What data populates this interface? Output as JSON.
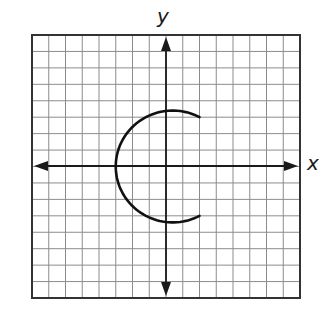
{
  "chart_data": {
    "type": "line",
    "title": "",
    "xlabel": "x",
    "ylabel": "y",
    "xlim": [
      -8,
      8
    ],
    "ylim": [
      -8,
      8
    ],
    "grid": true,
    "grid_units": {
      "columns": 16,
      "rows": 16,
      "step": 1
    },
    "axes_arrows": true,
    "tick_labels": false,
    "series": [
      {
        "name": "curve",
        "shape": "circular arc (open on right)",
        "circle_center": [
          0.4,
          0
        ],
        "radius": 3.4,
        "start_point": [
          2,
          3
        ],
        "end_point": [
          2,
          -3
        ],
        "passes_through": [
          [
            2,
            3
          ],
          [
            0.4,
            3.4
          ],
          [
            -3,
            0
          ],
          [
            0.4,
            -3.4
          ],
          [
            2,
            -3
          ]
        ],
        "direction": "counterclockwise from (2,3) through (-3,0) to (2,-3)"
      }
    ]
  },
  "labels": {
    "x_axis": "x",
    "y_axis": "y"
  },
  "colors": {
    "grid": "#8c8c8c",
    "border": "#333333",
    "axes": "#1a1a1a",
    "curve": "#111111",
    "background": "#ffffff"
  }
}
